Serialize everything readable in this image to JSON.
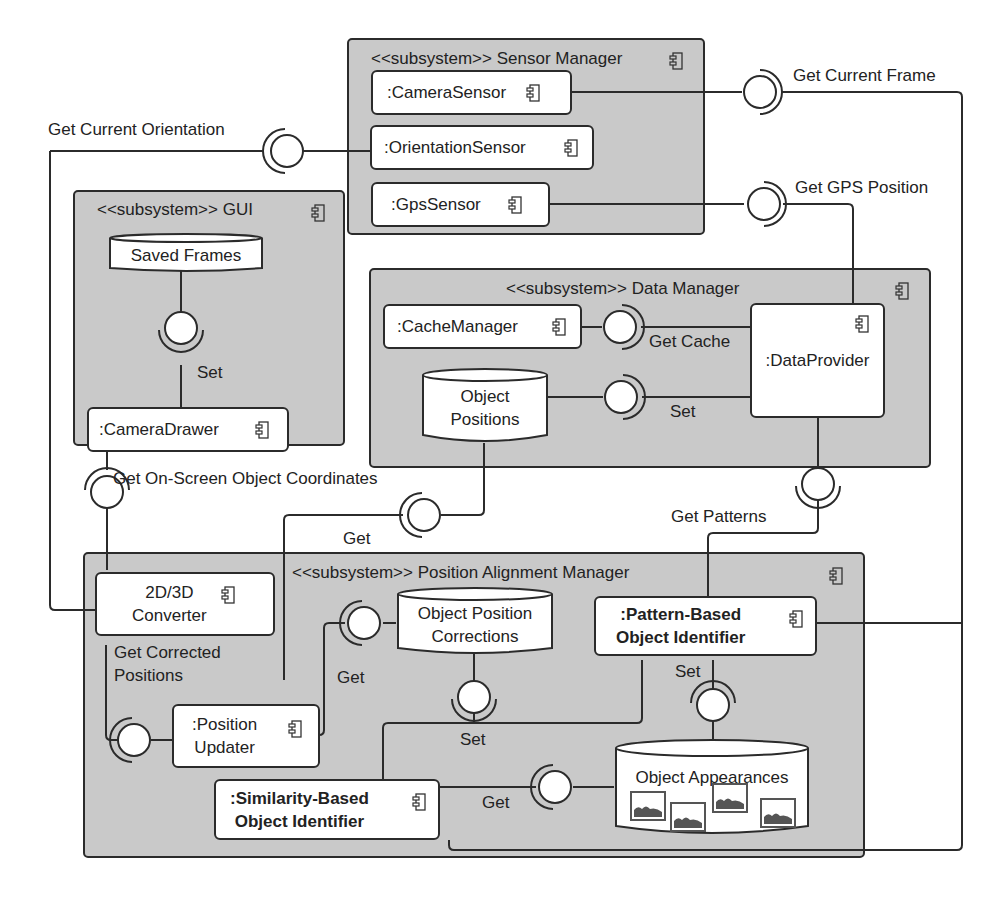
{
  "diagram": {
    "type": "UML component diagram",
    "colors": {
      "subsystem_fill": "#c9c9c9",
      "stroke": "#2b2b2b",
      "component_fill": "#ffffff"
    }
  },
  "subsystems": {
    "sensor_manager": {
      "title": "<<subsystem>> Sensor Manager"
    },
    "gui": {
      "title": "<<subsystem>> GUI"
    },
    "data_manager": {
      "title": "<<subsystem>> Data Manager"
    },
    "position_alignment_manager": {
      "title": "<<subsystem>> Position Alignment Manager"
    }
  },
  "components": {
    "camera_sensor": ":CameraSensor",
    "orientation_sensor": ":OrientationSensor",
    "gps_sensor": ":GpsSensor",
    "camera_drawer": ":CameraDrawer",
    "cache_manager": ":CacheManager",
    "data_provider": ":DataProvider",
    "converter": "2D/3D\nConverter",
    "position_updater": ":Position\nUpdater",
    "pattern_identifier": ":Pattern-Based\nObject Identifier",
    "similarity_identifier": ":Similarity-Based\nObject Identifier"
  },
  "datastores": {
    "saved_frames": "Saved Frames",
    "object_positions": "Object\nPositions",
    "object_position_corrections": "Object Position\nCorrections",
    "object_appearances": "Object Appearances"
  },
  "interfaces": {
    "get_current_frame": "Get Current Frame",
    "get_current_orientation": "Get Current Orientation",
    "get_gps_position": "Get GPS Position",
    "gui_set": "Set",
    "get_cache": "Get Cache",
    "data_set": "Set",
    "get_onscreen_coords": "Get On-Screen Object Coordinates",
    "get_object_positions": "Get",
    "get_patterns": "Get Patterns",
    "get_corrected_positions": "Get Corrected\nPositions",
    "get_corrections": "Get",
    "set_corrections": "Set",
    "set_appearances": "Set",
    "get_appearances": "Get"
  }
}
